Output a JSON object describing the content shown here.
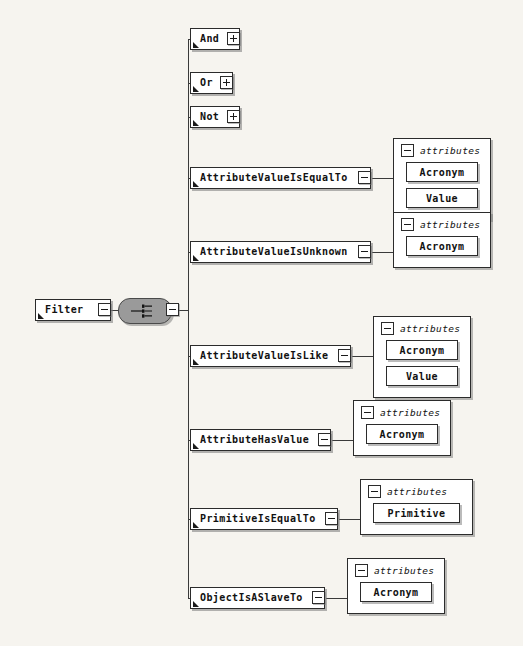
{
  "diagram": {
    "background_color": "#f6f4ef",
    "line_color": "#3a3a3a",
    "compositor_color": "#9a9a9a",
    "box_fill": "#ffffff",
    "box_border": "#2b2b2b"
  },
  "root": {
    "label": "Filter",
    "toggle_left": "minus",
    "toggle_right": "minus",
    "compositor_type": "choice"
  },
  "attributes_label": "attributes",
  "children": [
    {
      "label": "And",
      "toggle": "plus",
      "attributes": []
    },
    {
      "label": "Or",
      "toggle": "plus",
      "attributes": []
    },
    {
      "label": "Not",
      "toggle": "plus",
      "attributes": []
    },
    {
      "label": "AttributeValueIsEqualTo",
      "toggle": "minus",
      "attributes": [
        "Acronym",
        "Value"
      ]
    },
    {
      "label": "AttributeValueIsUnknown",
      "toggle": "minus",
      "attributes": [
        "Acronym"
      ]
    },
    {
      "label": "AttributeValueIsLike",
      "toggle": "minus",
      "attributes": [
        "Acronym",
        "Value"
      ]
    },
    {
      "label": "AttributeHasValue",
      "toggle": "minus",
      "attributes": [
        "Acronym"
      ]
    },
    {
      "label": "PrimitiveIsEqualTo",
      "toggle": "minus",
      "attributes": [
        "Primitive"
      ]
    },
    {
      "label": "ObjectIsASlaveTo",
      "toggle": "minus",
      "attributes": [
        "Acronym"
      ]
    }
  ]
}
